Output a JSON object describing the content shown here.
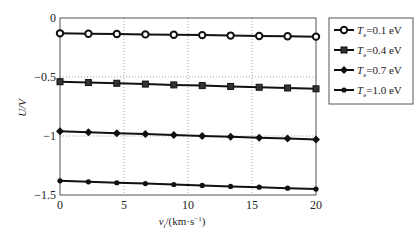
{
  "chart_data": {
    "type": "line",
    "title": "",
    "xlabel": "v_t/(km·s^-1)",
    "xlabel_parts": {
      "main": "v",
      "sub": "t",
      "rest": "/(km·s",
      "sup": "−1",
      "end": ")"
    },
    "ylabel": "U/V",
    "xlim": [
      0,
      20
    ],
    "ylim": [
      -1.5,
      0
    ],
    "xticks": [
      0,
      5,
      10,
      15,
      20
    ],
    "xtick_labels": [
      "0",
      "5",
      "10",
      "15",
      "20"
    ],
    "yticks": [
      0,
      -0.5,
      -1,
      -1.5
    ],
    "ytick_labels": [
      "0",
      "−0.5",
      "−1",
      "−1.5"
    ],
    "grid": true,
    "legend_position": "outside-right",
    "x": [
      0,
      2.22,
      4.44,
      6.67,
      8.89,
      11.11,
      13.33,
      15.56,
      17.78,
      20
    ],
    "series": [
      {
        "name": "Te=0.1 eV",
        "label_main": "T",
        "label_sub": "e",
        "label_rest": "=0.1 eV",
        "marker": "circle-open",
        "values": [
          -0.13,
          -0.133,
          -0.136,
          -0.139,
          -0.142,
          -0.145,
          -0.149,
          -0.152,
          -0.155,
          -0.158
        ]
      },
      {
        "name": "Te=0.4 eV",
        "label_main": "T",
        "label_sub": "e",
        "label_rest": "=0.4 eV",
        "marker": "square",
        "values": [
          -0.54,
          -0.547,
          -0.553,
          -0.56,
          -0.567,
          -0.573,
          -0.58,
          -0.587,
          -0.593,
          -0.6
        ]
      },
      {
        "name": "Te=0.7 eV",
        "label_main": "T",
        "label_sub": "e",
        "label_rest": "=0.7 eV",
        "marker": "diamond",
        "values": [
          -0.96,
          -0.968,
          -0.976,
          -0.983,
          -0.991,
          -0.999,
          -1.007,
          -1.014,
          -1.022,
          -1.03
        ]
      },
      {
        "name": "Te=1.0 eV",
        "label_main": "T",
        "label_sub": "e",
        "label_rest": "=1.0 eV",
        "marker": "dot",
        "values": [
          -1.38,
          -1.388,
          -1.396,
          -1.403,
          -1.411,
          -1.419,
          -1.427,
          -1.434,
          -1.442,
          -1.45
        ]
      }
    ]
  }
}
